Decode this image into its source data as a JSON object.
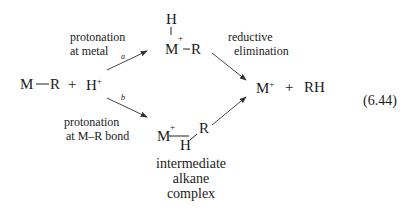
{
  "reactants": {
    "metal": "M",
    "alkyl": "R",
    "plus": "+",
    "proton": "H",
    "proton_charge": "+"
  },
  "path_a": {
    "label_line1": "protonation",
    "label_line2": "at metal",
    "arrow_letter": "a",
    "intermediate": {
      "hydride": "H",
      "metal": "M",
      "charge": "+",
      "alkyl": "R"
    }
  },
  "path_b": {
    "label_line1": "protonation",
    "label_line2": "at M–R bond",
    "arrow_letter": "b",
    "intermediate": {
      "metal": "M",
      "charge": "+",
      "hydrogen": "H",
      "alkyl": "R",
      "caption_line1": "intermediate",
      "caption_line2": "alkane",
      "caption_line3": "complex"
    }
  },
  "elimination": {
    "label_line1": "reductive",
    "label_line2": "elimination"
  },
  "products": {
    "metal": "M",
    "charge": "+",
    "plus": "+",
    "alkane": "RH"
  },
  "equation_number": "(6.44)"
}
